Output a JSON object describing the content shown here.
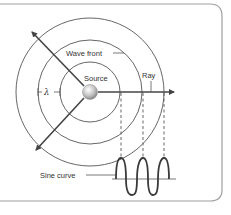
{
  "diagram": {
    "labels": {
      "wave_front": "Wave front",
      "source": "Source",
      "ray": "Ray",
      "lambda": "λ",
      "sine_curve": "Sine curve"
    },
    "colors": {
      "line": "#4a4a4a",
      "panel_border": "#9a9a9a",
      "source_fill": "#c8c8c8"
    }
  }
}
